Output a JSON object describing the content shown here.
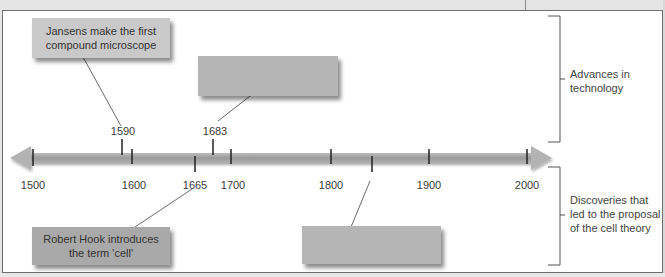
{
  "axis": {
    "start_year": 1500,
    "end_year": 2000,
    "ticks": [
      {
        "year": 1500,
        "label": "1500"
      },
      {
        "year": 1600,
        "label": "1600"
      },
      {
        "year": 1700,
        "label": "1700"
      },
      {
        "year": 1800,
        "label": "1800"
      },
      {
        "year": 1900,
        "label": "1900"
      },
      {
        "year": 2000,
        "label": "2000"
      }
    ]
  },
  "events_above": [
    {
      "year": 1590,
      "label": "1590",
      "text": "Jansens make the first\ncompound microscope"
    },
    {
      "year": 1683,
      "label": "1683",
      "text": ""
    }
  ],
  "events_below": [
    {
      "year": 1665,
      "label": "1665",
      "text": "Robert Hook introduces\nthe term 'cell'"
    },
    {
      "year": 1839,
      "label": "",
      "text": ""
    }
  ],
  "brackets": {
    "top": "Advances in\ntechnology",
    "bottom": "Discoveries that\nled to the proposal\nof the cell theory"
  },
  "colors": {
    "timeline_bar": "#9a9a9a",
    "tick": "#222222",
    "box_light": "#c9c9c9",
    "box_dark": "#a9a9a9",
    "box_blank": "#b5b5b5"
  }
}
